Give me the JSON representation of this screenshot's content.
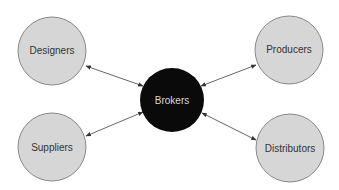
{
  "diagram": {
    "center": {
      "label": "Brokers",
      "cx": 172,
      "cy": 100,
      "r": 32,
      "fill": "#0a0a0a",
      "text_color": "#d8d8d8"
    },
    "nodes": [
      {
        "id": "designers",
        "label": "Designers",
        "cx": 52,
        "cy": 51,
        "r": 34,
        "fill": "#d6d6d6",
        "text_color": "#333333"
      },
      {
        "id": "producers",
        "label": "Producers",
        "cx": 289,
        "cy": 50,
        "r": 34,
        "fill": "#d6d6d6",
        "text_color": "#333333"
      },
      {
        "id": "suppliers",
        "label": "Suppliers",
        "cx": 52,
        "cy": 147,
        "r": 34,
        "fill": "#d6d6d6",
        "text_color": "#333333"
      },
      {
        "id": "distributors",
        "label": "Distributors",
        "cx": 290,
        "cy": 148,
        "r": 34,
        "fill": "#d6d6d6",
        "text_color": "#333333"
      }
    ],
    "edges": [
      {
        "from": "designers",
        "to": "brokers",
        "type": "bidirectional"
      },
      {
        "from": "producers",
        "to": "brokers",
        "type": "bidirectional"
      },
      {
        "from": "suppliers",
        "to": "brokers",
        "type": "bidirectional"
      },
      {
        "from": "distributors",
        "to": "brokers",
        "type": "bidirectional"
      }
    ]
  }
}
